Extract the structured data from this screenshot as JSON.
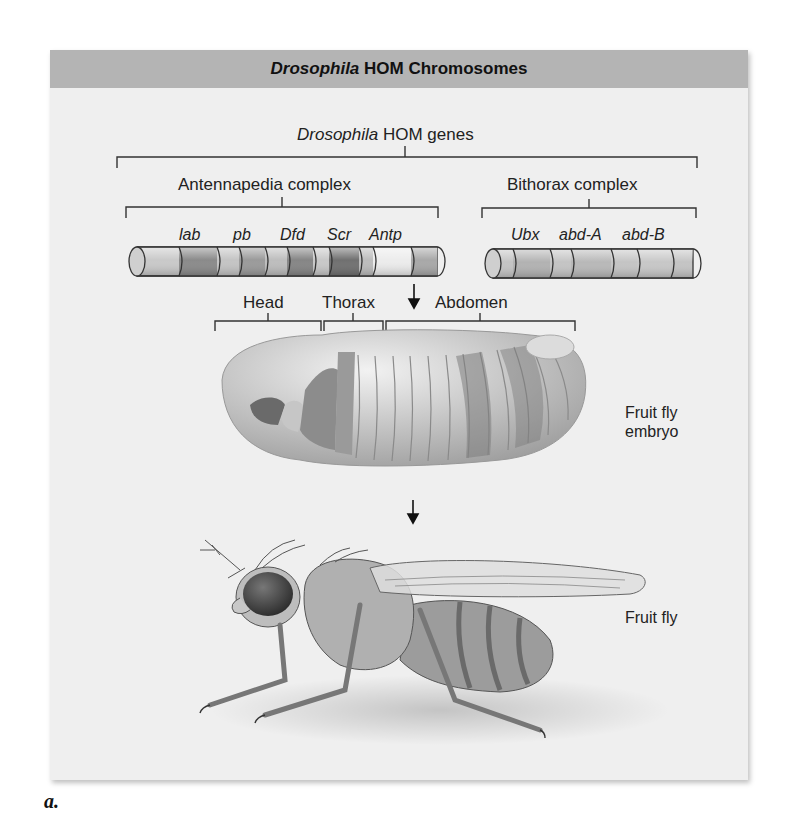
{
  "panel": {
    "title_italic": "Drosophila",
    "title_rest": " HOM Chromosomes"
  },
  "hierarchy": {
    "top_italic": "Drosophila",
    "top_rest": " HOM genes",
    "complexes": [
      {
        "label": "Antennapedia complex",
        "genes": [
          "lab",
          "pb",
          "Dfd",
          "Scr",
          "Antp"
        ]
      },
      {
        "label": "Bithorax complex",
        "genes": [
          "Ubx",
          "abd-A",
          "abd-B"
        ]
      }
    ]
  },
  "body_regions": [
    "Head",
    "Thorax",
    "Abdomen"
  ],
  "stages": {
    "embryo_line1": "Fruit fly",
    "embryo_line2": "embryo",
    "adult": "Fruit fly"
  },
  "figure_label": "a.",
  "colors": {
    "header_bg": "#b4b4b4",
    "panel_bg": "#efefef"
  }
}
